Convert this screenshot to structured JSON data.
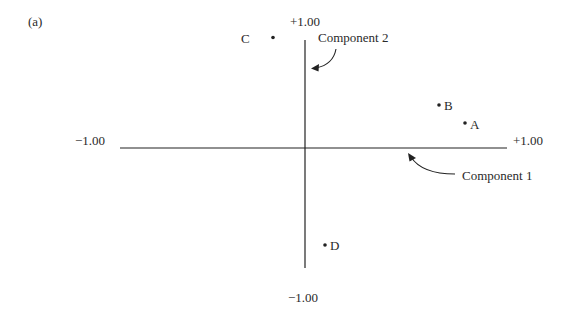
{
  "panel_label": "(a)",
  "axes": {
    "x": {
      "name": "Component 1",
      "min_label": "−1.00",
      "max_label": "+1.00",
      "range": [
        -1.0,
        1.0
      ]
    },
    "y": {
      "name": "Component 2",
      "min_label": "−1.00",
      "max_label": "+1.00",
      "range": [
        -1.0,
        1.0
      ]
    }
  },
  "points": [
    {
      "label": "A",
      "x": 0.82,
      "y": 0.22
    },
    {
      "label": "B",
      "x": 0.69,
      "y": 0.37
    },
    {
      "label": "C",
      "x": -0.17,
      "y": 0.93
    },
    {
      "label": "D",
      "x": 0.1,
      "y": -0.79
    }
  ],
  "annotations": {
    "component1": "Component 1",
    "component2": "Component 2"
  },
  "colors": {
    "ink": "#222222",
    "background": "#ffffff"
  }
}
